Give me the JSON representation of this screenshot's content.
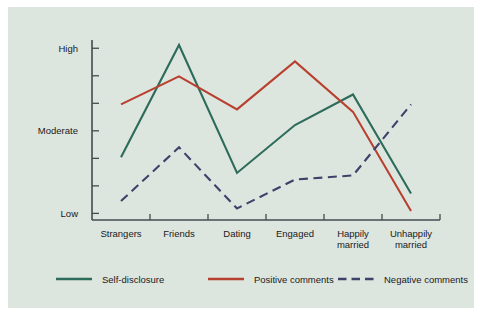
{
  "chart_data": {
    "type": "line",
    "title": "",
    "subtitle": "",
    "xlabel": "",
    "ylabel": "",
    "categories": [
      "Strangers",
      "Friends",
      "Dating",
      "Engaged",
      "Happily married",
      "Unhappily married"
    ],
    "category_labels_wrapped": [
      [
        "Strangers"
      ],
      [
        "Friends"
      ],
      [
        "Dating"
      ],
      [
        "Engaged"
      ],
      [
        "Happily",
        "married"
      ],
      [
        "Unhappily",
        "married"
      ]
    ],
    "ytick_labels": [
      "High",
      "Moderate",
      "Low"
    ],
    "ytick_values": [
      2.0,
      1.0,
      0.0
    ],
    "ylim": [
      -0.08,
      2.1
    ],
    "y_minor_tick_count": 7,
    "grid": false,
    "legend_position": "bottom",
    "series": [
      {
        "name": "Self-disclosure",
        "color": "#2d6b5a",
        "style": "solid",
        "values": [
          0.68,
          2.04,
          0.49,
          1.07,
          1.44,
          0.24
        ]
      },
      {
        "name": "Positive comments",
        "color": "#b8402e",
        "style": "solid",
        "values": [
          1.32,
          1.66,
          1.26,
          1.84,
          1.23,
          0.03
        ]
      },
      {
        "name": "Negative comments",
        "color": "#3d4268",
        "style": "dashed",
        "values": [
          0.15,
          0.8,
          0.06,
          0.41,
          0.46,
          1.32
        ]
      }
    ]
  },
  "legend": {
    "items": [
      {
        "label": "Self-disclosure",
        "color": "#2d6b5a",
        "style": "solid"
      },
      {
        "label": "Positive comments",
        "color": "#b8402e",
        "style": "solid"
      },
      {
        "label": "Negative comments",
        "color": "#3d4268",
        "style": "dashed"
      }
    ]
  },
  "colors": {
    "panel_background": "#dde5df",
    "page_background": "#ffffff",
    "axis": "#454b4f",
    "text": "#1a1a1a",
    "self_disclosure": "#2d6b5a",
    "positive_comments": "#b8402e",
    "negative_comments": "#3d4268"
  }
}
